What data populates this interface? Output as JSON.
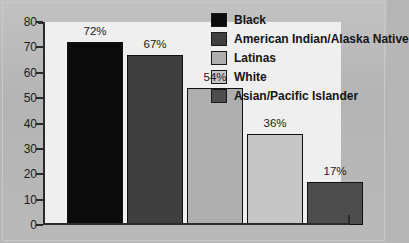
{
  "chart_data": {
    "type": "bar",
    "title": "",
    "subtitle": "",
    "xlabel": "",
    "ylabel": "",
    "ylim": [
      0,
      80
    ],
    "y_ticks": [
      0,
      10,
      20,
      30,
      40,
      50,
      60,
      70,
      80
    ],
    "grid": false,
    "legend_position": "top-right",
    "categories": [
      "Black",
      "American Indian/Alaska Native",
      "Latinas",
      "White",
      "Asian/Pacific Islander"
    ],
    "values": [
      72,
      67,
      54,
      36,
      17
    ],
    "data_labels": [
      "72%",
      "67%",
      "54%",
      "36%",
      "17%"
    ],
    "colors": [
      "#0b0b0b",
      "#3f3f3f",
      "#aeaeae",
      "#c6c6c6",
      "#4d4d4d"
    ],
    "legend": [
      {
        "label": "Black",
        "color": "#0b0b0b"
      },
      {
        "label": "American Indian/Alaska Native",
        "color": "#3f3f3f"
      },
      {
        "label": "Latinas",
        "color": "#aeaeae"
      },
      {
        "label": "White",
        "color": "#c6c6c6"
      },
      {
        "label": "Asian/Pacific Islander",
        "color": "#4d4d4d"
      }
    ]
  },
  "figure": {
    "background_color": "#b6b6b6",
    "plot_background_color": "#efefef",
    "axis_color": "#2b2b2b"
  }
}
